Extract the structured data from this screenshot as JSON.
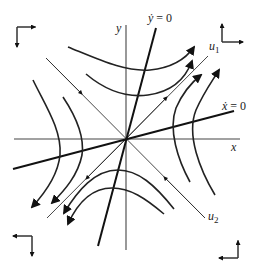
{
  "diagram": {
    "axes": {
      "x_label": "x",
      "y_label": "y"
    },
    "nullclines": [
      {
        "id": "ydot",
        "label_var": "ẏ",
        "label_rest": " = 0"
      },
      {
        "id": "xdot",
        "label_var": "ẋ",
        "label_rest": " = 0"
      }
    ],
    "eigenvectors": [
      {
        "id": "u1",
        "label_base": "u",
        "label_sub": "1",
        "direction": "unstable (outward)"
      },
      {
        "id": "u2",
        "label_base": "u",
        "label_sub": "2",
        "direction": "stable (inward)"
      }
    ],
    "equilibrium": "saddle at origin",
    "corner_indicators": [
      {
        "position": "top-left",
        "arrows": [
          "right",
          "down"
        ]
      },
      {
        "position": "top-right",
        "arrows": [
          "up",
          "right"
        ]
      },
      {
        "position": "bottom-left",
        "arrows": [
          "left",
          "down"
        ]
      },
      {
        "position": "bottom-right",
        "arrows": [
          "up",
          "left"
        ]
      }
    ],
    "colors": {
      "ink": "#222222",
      "background": "#ffffff"
    }
  }
}
